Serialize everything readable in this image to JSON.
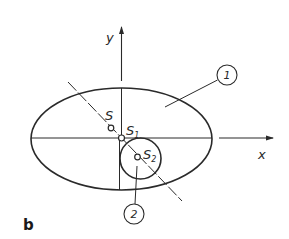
{
  "axes": {
    "x_label": "x",
    "y_label": "y"
  },
  "points": {
    "S": {
      "label": "S",
      "subscript": ""
    },
    "S1": {
      "label": "S",
      "subscript": "1"
    },
    "S2": {
      "label": "S",
      "subscript": "2"
    }
  },
  "callouts": [
    {
      "number": "1",
      "refers_to": "ellipse"
    },
    {
      "number": "2",
      "refers_to": "circle"
    }
  ],
  "panel_label": "b",
  "colors": {
    "stroke": "#2a2a2a",
    "background": "#ffffff"
  }
}
